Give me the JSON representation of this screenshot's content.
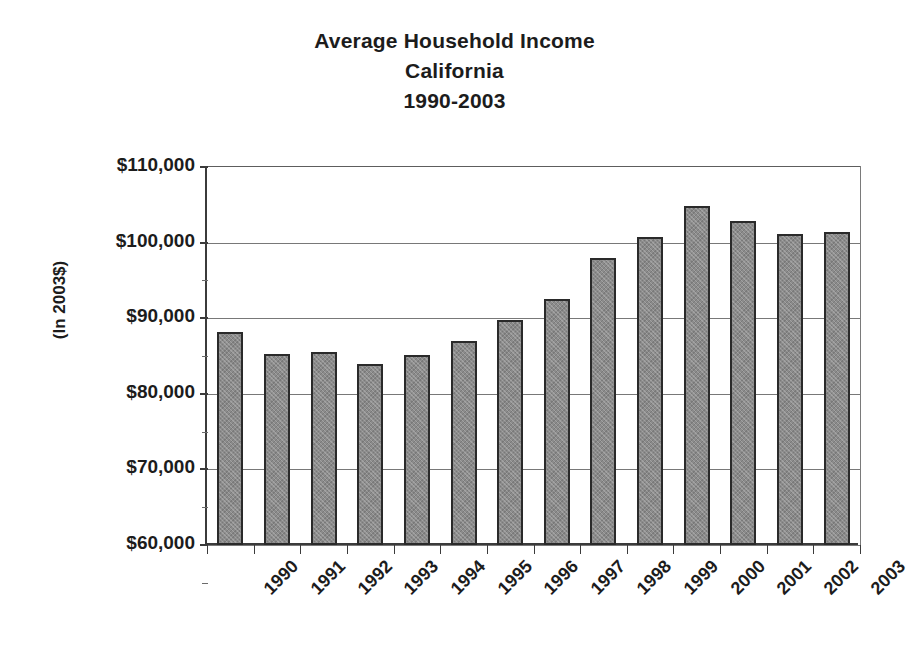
{
  "title": {
    "line1": "Average Household Income",
    "line2": "California",
    "line3": "1990-2003"
  },
  "axes": {
    "y_title": "(In 2003$)",
    "y_tick_labels": [
      "$110,000",
      "$100,000",
      "$90,000",
      "$80,000",
      "$70,000",
      "$60,000"
    ]
  },
  "colors": {
    "bar_fill": "#8b8b8b",
    "bar_border": "#2a2a2a",
    "gridline": "#787878",
    "axis": "#3b3b3b",
    "text": "#1c1c1c",
    "background": "#ffffff"
  },
  "chart_data": {
    "type": "bar",
    "title": "Average Household Income California 1990-2003",
    "subtitle": "California",
    "xlabel": "",
    "ylabel": "(In 2003$)",
    "ylim": [
      60000,
      110000
    ],
    "ytick_values": [
      60000,
      70000,
      80000,
      90000,
      100000,
      110000
    ],
    "grid": true,
    "legend": false,
    "categories": [
      "1990",
      "1991",
      "1992",
      "1993",
      "1994",
      "1995",
      "1996",
      "1997",
      "1998",
      "1999",
      "2000",
      "2001",
      "2002",
      "2003"
    ],
    "values": [
      88200,
      85300,
      85500,
      84000,
      85200,
      87000,
      89700,
      92500,
      98000,
      100800,
      104800,
      102900,
      101200,
      101400
    ],
    "value_labels": [
      "$88,200",
      "$85,300",
      "$85,500",
      "$84,000",
      "$85,200",
      "$87,000",
      "$89,700",
      "$92,500",
      "$98,000",
      "$100,800",
      "$104,800",
      "$102,900",
      "$101,200",
      "$101,400"
    ]
  }
}
